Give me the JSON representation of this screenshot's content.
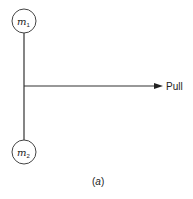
{
  "diagram": {
    "masses": [
      {
        "symbol": "m",
        "subscript": "1",
        "position": "top"
      },
      {
        "symbol": "m",
        "subscript": "2",
        "position": "bottom"
      }
    ],
    "force_label": "Pull",
    "caption": {
      "open": "(",
      "letter": "a",
      "close": ")"
    },
    "colors": {
      "stroke": "#333333",
      "background": "#ffffff"
    }
  }
}
